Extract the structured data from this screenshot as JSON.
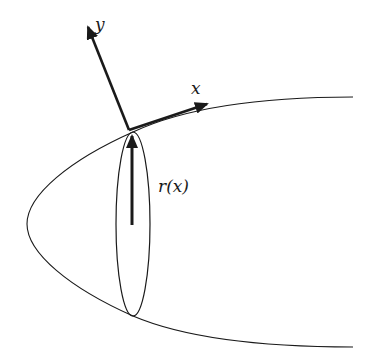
{
  "diagram": {
    "labels": {
      "y_axis": "y",
      "x_axis": "x",
      "radius": "r(x)"
    },
    "colors": {
      "stroke": "#1a1a1a",
      "background": "#ffffff"
    },
    "shapes": {
      "paraboloid_outline": "parabola opening right, vertex near (27,224)",
      "cross_section": "ellipse centered near (133,224)",
      "axes": [
        "y-axis arrow",
        "x-axis arrow (tangent)",
        "r(x) radius arrow"
      ]
    }
  }
}
